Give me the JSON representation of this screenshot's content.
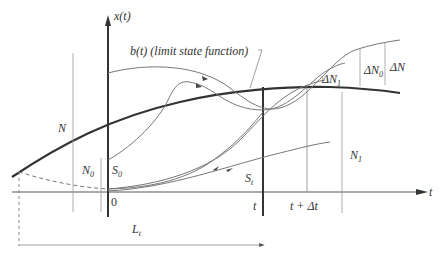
{
  "diagram": {
    "axes": {
      "y_label": "x(t)",
      "x_label": "t",
      "origin_label": "0"
    },
    "curves": {
      "limit_state_label": "b(t) (limit state function)"
    },
    "labels": {
      "N": "N",
      "N0": "N",
      "N0_sub": "0",
      "S0": "S",
      "S0_sub": "0",
      "St": "S",
      "St_sub": "t",
      "t": "t",
      "t_dt": "t + Δt",
      "dN": "ΔN",
      "dN0": "ΔN",
      "dN0_sub": "0",
      "dN1": "ΔN",
      "dN1_sub": "1",
      "N1": "N",
      "N1_sub": "1",
      "Lt": "L",
      "Lt_sub": "t"
    },
    "colors": {
      "thin_line": "#777777",
      "thick_line": "#333333",
      "text": "#333333"
    }
  }
}
